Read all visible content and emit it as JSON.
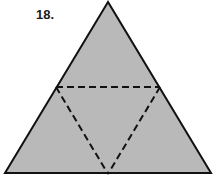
{
  "figure": {
    "number_label": "18.",
    "colors": {
      "fill": "#b9b9b9",
      "outline": "#111111",
      "fold_line": "#111111",
      "background": "#ffffff"
    },
    "outer_triangle": {
      "apex": [
        108,
        2
      ],
      "bottom_left": [
        5,
        173
      ],
      "bottom_right": [
        211,
        173
      ]
    },
    "fold_lines": [
      {
        "from": [
          56,
          87
        ],
        "to": [
          160,
          87
        ]
      },
      {
        "from": [
          56,
          87
        ],
        "to": [
          108,
          174
        ]
      },
      {
        "from": [
          160,
          87
        ],
        "to": [
          108,
          174
        ]
      }
    ],
    "line_style": {
      "outline": "solid",
      "folds": "dashed"
    }
  }
}
